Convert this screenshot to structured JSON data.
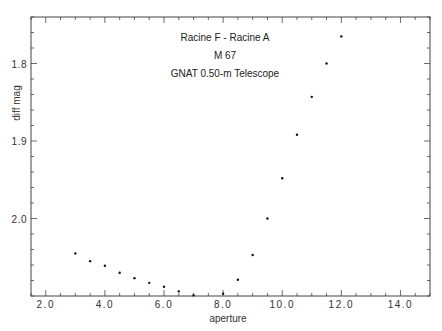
{
  "chart_data": {
    "type": "scatter",
    "title": "",
    "annotations": [
      "Racine F  -  Racine A",
      "M 67",
      "GNAT  0.50-m  Telescope"
    ],
    "xlabel": "aperture",
    "ylabel": "diff  mag",
    "xlim": [
      1.5,
      15.0
    ],
    "ylim": [
      2.1,
      1.74
    ],
    "y_inverted": true,
    "grid": false,
    "legend": null,
    "x_ticks": [
      2.0,
      4.0,
      6.0,
      8.0,
      10.0,
      12.0,
      14.0
    ],
    "x_tick_labels": [
      "2.0",
      "4.0",
      "6.0",
      "8.0",
      "10.0",
      "12.0",
      "14.0"
    ],
    "x_minor_step": 0.5,
    "y_ticks": [
      1.8,
      1.9,
      2.0
    ],
    "y_tick_labels": [
      "1.8",
      "1.9",
      "2.0"
    ],
    "y_minor_step": 0.02,
    "series": [
      {
        "name": "Racine F - Racine A",
        "x": [
          3.0,
          3.5,
          4.0,
          4.5,
          5.0,
          5.5,
          6.0,
          6.5,
          7.0,
          8.0,
          8.5,
          9.0,
          9.5,
          10.0,
          10.5,
          11.0,
          11.5,
          12.0
        ],
        "y": [
          2.045,
          2.055,
          2.061,
          2.07,
          2.077,
          2.083,
          2.088,
          2.094,
          2.099,
          2.097,
          2.079,
          2.047,
          2.0,
          1.948,
          1.892,
          1.843,
          1.8,
          1.765
        ]
      }
    ]
  },
  "colors": {
    "axis": "#444444",
    "points": "#111111",
    "background": "#ffffff"
  }
}
